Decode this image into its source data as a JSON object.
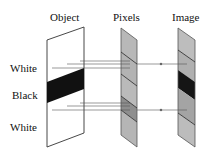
{
  "column_labels": {
    "object": "Object",
    "pixels": "Pixels",
    "image": "Image"
  },
  "row_labels": {
    "top": "White",
    "middle": "Black",
    "bottom": "White"
  },
  "colors": {
    "object_fill": "#ffffff",
    "object_band": "#111111",
    "pixel_light": "#b8b8b8",
    "pixel_mid": "#a8a8a8",
    "pixel_dark": "#8a8a8a",
    "image_light": "#bdbdbd",
    "image_mid": "#a6a6a6",
    "image_dark": "#151515",
    "outline": "#333333",
    "ray": "#555555"
  }
}
